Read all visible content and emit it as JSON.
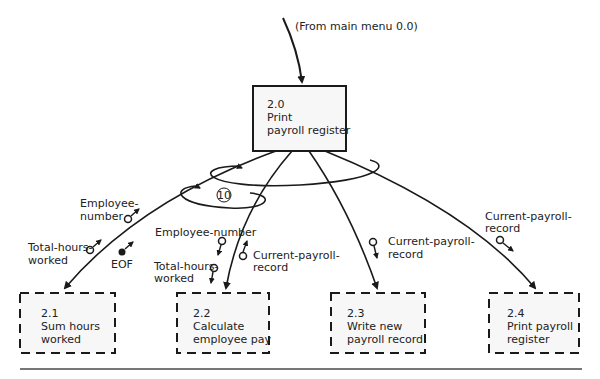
{
  "diagram": {
    "type": "structure-chart",
    "source_note": "(From main menu 0.0)",
    "root": {
      "id": "2.0",
      "name_line1": "Print",
      "name_line2": "payroll register"
    },
    "children": [
      {
        "id": "2.1",
        "line1": "Sum hours",
        "line2": "worked"
      },
      {
        "id": "2.2",
        "line1": "Calculate",
        "line2": "employee pay"
      },
      {
        "id": "2.3",
        "line1": "Write new",
        "line2": "payroll record"
      },
      {
        "id": "2.4",
        "line1": "Print payroll",
        "line2": "register"
      }
    ],
    "loop_label": "10",
    "couples": {
      "c21_empnum_1": "Employee-",
      "c21_empnum_2": "number",
      "c21_hours_1": "Total-hours-",
      "c21_hours_2": "worked",
      "c21_eof": "EOF",
      "c22_empnum": "Employee-number",
      "c22_hours_1": "Total-hours-",
      "c22_hours_2": "worked",
      "c22_rec_1": "Current-payroll-",
      "c22_rec_2": "record",
      "c23_rec_1": "Current-payroll-",
      "c23_rec_2": "record",
      "c24_rec_1": "Current-payroll-",
      "c24_rec_2": "record"
    },
    "colors": {
      "line": "#1a1a1a",
      "box_fill": "#f7f7f7",
      "rule": "#777777"
    }
  }
}
